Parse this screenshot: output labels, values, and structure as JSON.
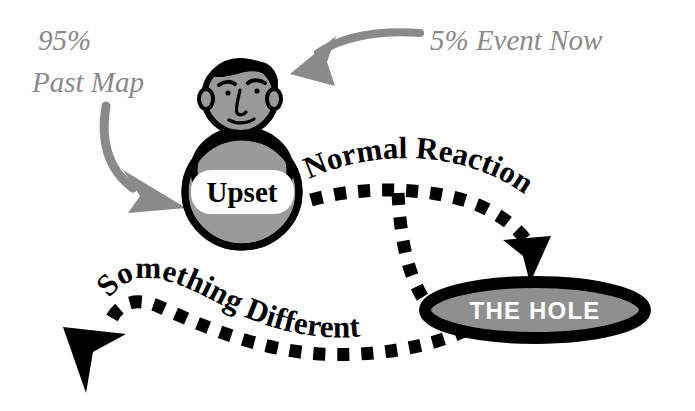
{
  "diagram": {
    "background_color": "#ffffff",
    "gray_color": "#8a8a8a",
    "black_color": "#000000",
    "figure_fill_color": "#9a9a9a",
    "hole_fill_color": "#8f8f8f"
  },
  "annotations": {
    "past_map_line1": "95%",
    "past_map_line2": "Past Map",
    "event_now": "5% Event Now"
  },
  "figure": {
    "emotion_label": "Upset"
  },
  "paths": {
    "normal_reaction": "Normal Reaction",
    "something_different": "Something Different"
  },
  "destination": {
    "hole_label": "THE HOLE"
  }
}
